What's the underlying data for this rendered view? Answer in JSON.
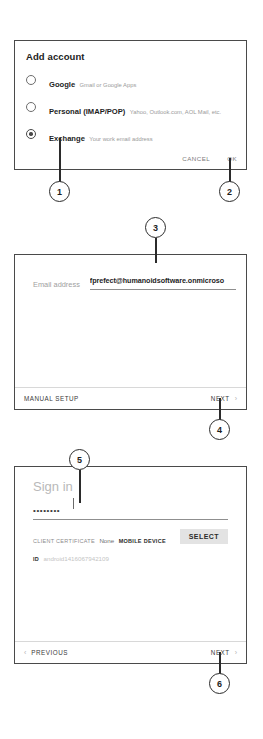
{
  "panel_add_account": {
    "title": "Add account",
    "options": [
      {
        "label": "Google",
        "sublabel": "Gmail or Google Apps",
        "selected": false
      },
      {
        "label": "Personal (IMAP/POP)",
        "sublabel": "Yahoo, Outlook.com, AOL Mail, etc.",
        "selected": false
      },
      {
        "label": "Exchange",
        "sublabel": "Your work email address",
        "selected": true
      }
    ],
    "cancel_label": "CANCEL",
    "ok_label": "OK"
  },
  "panel_email": {
    "field_label": "Email address",
    "field_value": "fprefect@humanoidsoftware.onmicroso",
    "manual_setup_label": "MANUAL SETUP",
    "next_label": "NEXT",
    "next_chevron": "chevron-right-icon"
  },
  "panel_signin": {
    "title": "Sign in",
    "password_value": "••••••••",
    "client_certificate_caption": "CLIENT CERTIFICATE",
    "client_certificate_value": "None",
    "select_label": "SELECT",
    "mobile_device_id_caption": "MOBILE DEVICE ID",
    "mobile_device_id_value": "android1416067942109",
    "previous_label": "PREVIOUS",
    "previous_chevron": "chevron-left-icon",
    "next_label": "NEXT",
    "next_chevron": "chevron-right-icon"
  },
  "callouts": [
    {
      "number": "1"
    },
    {
      "number": "2"
    },
    {
      "number": "3"
    },
    {
      "number": "4"
    },
    {
      "number": "5"
    },
    {
      "number": "6"
    }
  ],
  "colors": {
    "panel_border": "#4a4a4a",
    "text_primary": "#1d1d1d",
    "text_muted": "#9a9a9a",
    "button_fill": "#e3e3e3",
    "callout_stroke": "#2b2b2b"
  }
}
